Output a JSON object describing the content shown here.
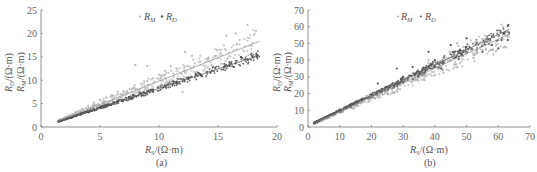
{
  "chart_data": [
    {
      "type": "scatter",
      "panel_label": "(a)",
      "xlabel": "R_S/(Ω·m)",
      "ylabel_outer": "R_D/(Ω·m)",
      "ylabel_inner": "R_M/(Ω·m)",
      "xlim": [
        0,
        20
      ],
      "ylim": [
        0,
        25
      ],
      "xticks": [
        "0",
        "5",
        "10",
        "15",
        "20"
      ],
      "yticks": [
        "0",
        "5",
        "10",
        "15",
        "20",
        "25"
      ],
      "grid": false,
      "legend": [
        "R_M",
        "R_D"
      ],
      "legend_position": "top-center",
      "series": [
        {
          "name": "R_M",
          "color": "#b8b8b8",
          "marker": "dot",
          "trend": {
            "x": [
              1.5,
              18.5
            ],
            "y": [
              1.3,
              18.3
            ]
          },
          "points": [
            [
              1.5,
              1.2
            ],
            [
              2,
              1.8
            ],
            [
              2.5,
              2.3
            ],
            [
              3,
              3.2
            ],
            [
              3.5,
              3.8
            ],
            [
              4,
              4.5
            ],
            [
              4.5,
              5.2
            ],
            [
              5,
              5.8
            ],
            [
              5.5,
              6.3
            ],
            [
              6,
              6.8
            ],
            [
              6.5,
              7.5
            ],
            [
              7,
              7.6
            ],
            [
              7.5,
              8.1
            ],
            [
              8,
              8.2
            ],
            [
              8.5,
              9.2
            ],
            [
              9,
              9.8
            ],
            [
              9.5,
              10.4
            ],
            [
              10,
              11.2
            ],
            [
              10.5,
              12
            ],
            [
              11,
              13
            ],
            [
              11.5,
              12.5
            ],
            [
              12.2,
              16
            ],
            [
              12.8,
              15.2
            ],
            [
              13.5,
              14
            ],
            [
              14.2,
              14.8
            ],
            [
              15.2,
              15.8
            ],
            [
              15.7,
              19.5
            ],
            [
              16.5,
              20
            ],
            [
              17.5,
              21.8
            ],
            [
              18.2,
              20.5
            ],
            [
              12,
              7.5
            ],
            [
              9,
              13
            ],
            [
              8,
              13.2
            ]
          ]
        },
        {
          "name": "R_D",
          "color": "#4a4a4a",
          "marker": "dot",
          "trend": {
            "x": [
              1.5,
              18.5
            ],
            "y": [
              1.2,
              15.3
            ]
          },
          "points": [
            [
              1.5,
              1.2
            ],
            [
              2.5,
              2
            ],
            [
              3.5,
              2.9
            ],
            [
              4.5,
              3.8
            ],
            [
              5.5,
              4.7
            ],
            [
              6.5,
              5.5
            ],
            [
              7.5,
              6.4
            ],
            [
              8.5,
              7.2
            ],
            [
              9.5,
              8
            ],
            [
              10.5,
              8.9
            ],
            [
              11.5,
              9.7
            ],
            [
              12.5,
              10.4
            ],
            [
              13.5,
              11.2
            ],
            [
              14.5,
              12
            ],
            [
              15.5,
              12.8
            ],
            [
              16.5,
              13.6
            ],
            [
              17.5,
              14.4
            ],
            [
              18.3,
              15
            ]
          ]
        }
      ]
    },
    {
      "type": "scatter",
      "panel_label": "(b)",
      "xlabel": "R_S/(Ω·m)",
      "ylabel_outer": "R_D/(Ω·m)",
      "ylabel_inner": "R_M/(Ω·m)",
      "xlim": [
        0,
        70
      ],
      "ylim": [
        0,
        70
      ],
      "xticks": [
        "0",
        "10",
        "20",
        "30",
        "40",
        "50",
        "60",
        "70"
      ],
      "yticks": [
        "0",
        "10",
        "20",
        "30",
        "40",
        "50",
        "60",
        "70"
      ],
      "grid": false,
      "legend": [
        "R_M",
        "R_D"
      ],
      "legend_position": "top-center",
      "series": [
        {
          "name": "R_M",
          "color": "#b0b0b0",
          "marker": "dot",
          "trend": {
            "x": [
              2,
              63.5
            ],
            "y": [
              2.2,
              55.5
            ]
          },
          "points": [
            [
              2,
              2
            ],
            [
              5,
              5
            ],
            [
              10,
              9.5
            ],
            [
              15,
              13.5
            ],
            [
              20,
              18
            ],
            [
              25,
              22
            ],
            [
              30,
              27
            ],
            [
              35,
              31
            ],
            [
              40,
              36
            ],
            [
              45,
              40
            ],
            [
              50,
              45
            ],
            [
              55,
              49
            ],
            [
              60,
              52
            ],
            [
              63,
              55
            ],
            [
              47,
              50
            ],
            [
              38,
              40
            ]
          ]
        },
        {
          "name": "R_D",
          "color": "#505050",
          "marker": "dot",
          "trend": {
            "x": [
              2,
              63.5
            ],
            "y": [
              2.5,
              58.5
            ]
          },
          "points": [
            [
              2,
              2.5
            ],
            [
              5,
              5.5
            ],
            [
              10,
              10.5
            ],
            [
              15,
              15
            ],
            [
              20,
              19.5
            ],
            [
              22,
              26
            ],
            [
              25,
              24
            ],
            [
              28,
              35
            ],
            [
              30,
              30
            ],
            [
              33,
              36
            ],
            [
              35,
              33
            ],
            [
              38,
              45
            ],
            [
              40,
              40
            ],
            [
              42,
              35
            ],
            [
              45,
              49
            ],
            [
              48,
              44
            ],
            [
              50,
              53
            ],
            [
              55,
              45
            ],
            [
              58,
              49
            ],
            [
              60,
              47
            ],
            [
              63,
              52
            ],
            [
              61,
              52
            ]
          ]
        }
      ]
    }
  ],
  "labels": {
    "a": {
      "legend_m_base": "R",
      "legend_m_sub": "M",
      "legend_d_base": "R",
      "legend_d_sub": "D",
      "ylabel_outer_base": "R",
      "ylabel_outer_sub": "D",
      "ylabel_unit": "/(Ω·m)",
      "ylabel_inner_base": "R",
      "ylabel_inner_sub": "M",
      "xlabel_base": "R",
      "xlabel_sub": "S",
      "xlabel_unit": "/(Ω·m)",
      "panel": "(a)"
    },
    "b": {
      "legend_m_base": "R",
      "legend_m_sub": "M",
      "legend_d_base": "R",
      "legend_d_sub": "D",
      "ylabel_outer_base": "R",
      "ylabel_outer_sub": "D",
      "ylabel_unit": "/(Ω·m)",
      "ylabel_inner_base": "R",
      "ylabel_inner_sub": "M",
      "xlabel_base": "R",
      "xlabel_sub": "S",
      "xlabel_unit": "/(Ω·m)",
      "panel": "(b)"
    }
  }
}
